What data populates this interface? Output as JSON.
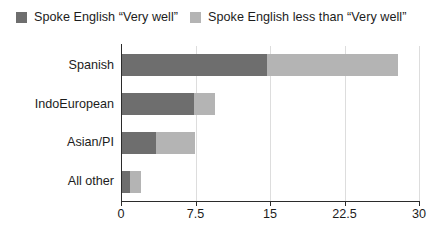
{
  "chart_data": {
    "type": "bar",
    "orientation": "horizontal",
    "stacked": true,
    "title": "",
    "xlabel": "",
    "ylabel": "",
    "categories": [
      "Spanish",
      "IndoEuropean",
      "Asian/PI",
      "All other"
    ],
    "series": [
      {
        "name": "Spoke English “Very well”",
        "color": "#6e6e6e",
        "values": [
          14.7,
          7.3,
          3.5,
          0.9
        ]
      },
      {
        "name": "Spoke English less than “Very well”",
        "color": "#b4b4b4",
        "values": [
          13.2,
          2.2,
          4.0,
          1.1
        ]
      }
    ],
    "totals": [
      27.9,
      9.5,
      7.5,
      2.0
    ],
    "xlim": [
      0,
      30
    ],
    "xticks": [
      0,
      7.5,
      15,
      22.5,
      30
    ],
    "xtick_labels": [
      "0",
      "7.5",
      "15",
      "22.5",
      "30"
    ],
    "grid": "vertical",
    "legend_position": "top"
  },
  "legend": {
    "items": [
      {
        "label": "Spoke English “Very well”",
        "swatch_color": "#6e6e6e"
      },
      {
        "label": "Spoke English less than “Very well”",
        "swatch_color": "#b4b4b4"
      }
    ]
  },
  "axis": {
    "tick_labels": [
      "0",
      "7.5",
      "15",
      "22.5",
      "30"
    ]
  },
  "categories": [
    "Spanish",
    "IndoEuropean",
    "Asian/PI",
    "All other"
  ],
  "colors": {
    "series_dark": "#6e6e6e",
    "series_light": "#b4b4b4",
    "axis": "#2b2b2b",
    "gridline": "#dddddd",
    "text": "#1c1c1c",
    "background": "#ffffff"
  }
}
